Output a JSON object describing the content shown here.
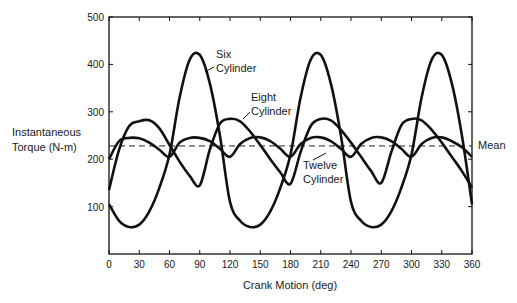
{
  "chart_data": {
    "type": "line",
    "title": "",
    "xlabel": "Crank Motion (deg)",
    "ylabel_lines": [
      "Instantaneous",
      "Torque (N-m)"
    ],
    "xlim": [
      0,
      360
    ],
    "ylim": [
      0,
      500
    ],
    "grid": false,
    "x_ticks": [
      0,
      30,
      60,
      90,
      120,
      150,
      180,
      210,
      240,
      270,
      300,
      330,
      360
    ],
    "y_ticks": [
      100,
      200,
      300,
      400,
      500
    ],
    "x": [
      0,
      10,
      20,
      30,
      40,
      50,
      60,
      70,
      80,
      90,
      100,
      110,
      120,
      130,
      140,
      150,
      160,
      170,
      180,
      190,
      200,
      210,
      220,
      230,
      240,
      250,
      260,
      270,
      280,
      290,
      300,
      310,
      320,
      330,
      340,
      350,
      360
    ],
    "series": [
      {
        "name": "Six Cylinder",
        "label_lines": [
          "Six",
          "Cylinder"
        ],
        "values": [
          105,
          70,
          57,
          62,
          90,
          140,
          210,
          330,
          410,
          420,
          360,
          250,
          110,
          70,
          57,
          62,
          90,
          140,
          210,
          330,
          410,
          420,
          360,
          250,
          110,
          70,
          57,
          62,
          90,
          140,
          210,
          330,
          410,
          420,
          360,
          250,
          105
        ]
      },
      {
        "name": "Eight Cylinder",
        "label_lines": [
          "Eight",
          "Cylinder"
        ],
        "values": [
          135,
          220,
          270,
          280,
          282,
          265,
          230,
          195,
          165,
          145,
          220,
          275,
          285,
          280,
          258,
          230,
          200,
          172,
          148,
          215,
          270,
          285,
          282,
          262,
          235,
          205,
          175,
          150,
          215,
          272,
          285,
          282,
          262,
          235,
          205,
          175,
          140
        ]
      },
      {
        "name": "Twelve Cylinder",
        "label_lines": [
          "Twelve",
          "Cylinder"
        ],
        "values": [
          200,
          238,
          245,
          244,
          235,
          220,
          205,
          235,
          245,
          245,
          238,
          222,
          205,
          232,
          245,
          246,
          238,
          222,
          205,
          232,
          245,
          246,
          238,
          222,
          205,
          232,
          245,
          246,
          238,
          222,
          205,
          232,
          245,
          246,
          238,
          225,
          205
        ]
      }
    ],
    "mean": {
      "label": "Mean",
      "value": 228
    }
  }
}
